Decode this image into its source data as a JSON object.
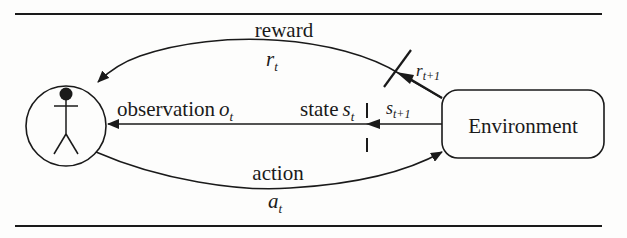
{
  "diagram": {
    "type": "reinforcement-learning-loop",
    "nodes": {
      "agent": {
        "shape": "circle",
        "icon": "stick-figure-icon"
      },
      "environment": {
        "shape": "rounded-rectangle",
        "label": "Environment"
      }
    },
    "edges": {
      "reward": {
        "label": "reward",
        "symbol": "r",
        "subscript": "t",
        "from": "environment",
        "to": "agent"
      },
      "reward_next": {
        "symbol": "r",
        "subscript": "t+1"
      },
      "observation": {
        "label": "observation",
        "symbol": "o",
        "subscript": "t",
        "from": "environment",
        "to": "agent"
      },
      "state": {
        "label": "state",
        "symbol": "s",
        "subscript": "t"
      },
      "state_next": {
        "symbol": "s",
        "subscript": "t+1"
      },
      "action": {
        "label": "action",
        "symbol": "a",
        "subscript": "t",
        "from": "agent",
        "to": "environment"
      }
    },
    "colors": {
      "stroke": "#1a1a1a",
      "background": "#fdfdfc"
    }
  }
}
